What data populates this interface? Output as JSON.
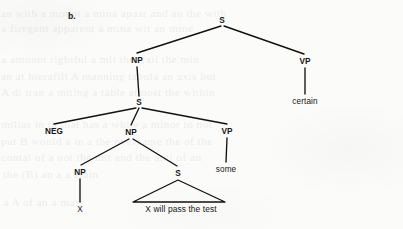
{
  "figure": {
    "label": "b.",
    "kind": "syntax-tree",
    "ink_color": "#111111",
    "page_color": "#fbfbfa"
  },
  "tree": {
    "nodes": [
      {
        "id": "s-root",
        "text": "S",
        "kind": "category",
        "x": 222,
        "y": 20
      },
      {
        "id": "np-1",
        "text": "NP",
        "kind": "category",
        "x": 137,
        "y": 60
      },
      {
        "id": "vp-1",
        "text": "VP",
        "kind": "category",
        "x": 305,
        "y": 61
      },
      {
        "id": "certain",
        "text": "certain",
        "kind": "terminal",
        "x": 305,
        "y": 101
      },
      {
        "id": "s-2",
        "text": "S",
        "kind": "category",
        "x": 139,
        "y": 102
      },
      {
        "id": "neg",
        "text": "NEG",
        "kind": "category",
        "x": 54,
        "y": 131
      },
      {
        "id": "np-2",
        "text": "NP",
        "kind": "category",
        "x": 131,
        "y": 132
      },
      {
        "id": "vp-2",
        "text": "VP",
        "kind": "category",
        "x": 227,
        "y": 131
      },
      {
        "id": "some",
        "text": "some",
        "kind": "terminal",
        "x": 226,
        "y": 169
      },
      {
        "id": "np-3",
        "text": "NP",
        "kind": "category",
        "x": 80,
        "y": 172
      },
      {
        "id": "s-3",
        "text": "S",
        "kind": "category",
        "x": 178,
        "y": 173
      },
      {
        "id": "x",
        "text": "X",
        "kind": "terminal",
        "x": 80,
        "y": 209
      },
      {
        "id": "sentence",
        "text": "X will pass the test",
        "kind": "phrase",
        "x": 181,
        "y": 209
      }
    ],
    "edges": [
      {
        "from": "s-root",
        "to": "np-1",
        "x1": 221,
        "y1": 26,
        "x2": 137,
        "y2": 53
      },
      {
        "from": "s-root",
        "to": "vp-1",
        "x1": 224,
        "y1": 26,
        "x2": 304,
        "y2": 54
      },
      {
        "from": "vp-1",
        "to": "certain",
        "x1": 305,
        "y1": 68,
        "x2": 305,
        "y2": 94
      },
      {
        "from": "np-1",
        "to": "s-2",
        "x1": 137,
        "y1": 67,
        "x2": 139,
        "y2": 96
      },
      {
        "from": "s-2",
        "to": "neg",
        "x1": 136,
        "y1": 108,
        "x2": 54,
        "y2": 124
      },
      {
        "from": "s-2",
        "to": "np-2",
        "x1": 139,
        "y1": 108,
        "x2": 131,
        "y2": 125
      },
      {
        "from": "s-2",
        "to": "vp-2",
        "x1": 142,
        "y1": 108,
        "x2": 227,
        "y2": 124
      },
      {
        "from": "vp-2",
        "to": "some",
        "x1": 227,
        "y1": 138,
        "x2": 226,
        "y2": 162
      },
      {
        "from": "np-2",
        "to": "np-3",
        "x1": 129,
        "y1": 139,
        "x2": 81,
        "y2": 165
      },
      {
        "from": "np-2",
        "to": "s-3",
        "x1": 133,
        "y1": 139,
        "x2": 177,
        "y2": 166
      },
      {
        "from": "np-3",
        "to": "x",
        "x1": 80,
        "y1": 179,
        "x2": 80,
        "y2": 202
      }
    ],
    "triangles": [
      {
        "under": "s-3",
        "apex_x": 178,
        "apex_y": 180,
        "left_x": 133,
        "left_y": 202,
        "right_x": 225,
        "right_y": 202
      }
    ]
  },
  "showthrough": {
    "lines": [
      {
        "x": 5,
        "y": 7,
        "text": "an with  a mount  a mina  apasr and  an the  with"
      },
      {
        "x": 5,
        "y": 22,
        "text": "a firegent  apparent  a mina  wit  an  mine"
      },
      {
        "x": 5,
        "y": 53,
        "text": "a  amount  rightful  a  mit  the  trail  the  min"
      },
      {
        "x": 5,
        "y": 70,
        "text": "an at  hierafill  A  manning  tabula  an  axis  but"
      },
      {
        "x": 5,
        "y": 86,
        "text": "A  di  tran  a  miting  a  table  atmost  the  within"
      },
      {
        "x": 5,
        "y": 118,
        "text": "milias  in th  that  has  a  while  a  minor  to  not"
      },
      {
        "x": 5,
        "y": 135,
        "text": "put  B  would  a  in  a  the  overcame  the  of  the"
      },
      {
        "x": 5,
        "y": 151,
        "text": "contal  of  a  not  the  mit  and  the  anti  of  an"
      },
      {
        "x": 5,
        "y": 168,
        "text": "the  (B)  an  a  a  amin"
      },
      {
        "x": 5,
        "y": 196,
        "text": "a  A  of  an  a  mati"
      }
    ]
  }
}
